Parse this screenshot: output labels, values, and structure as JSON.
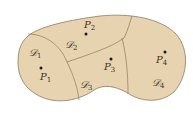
{
  "diagram": {
    "fill_color": "#e8d3b0",
    "stroke_color": "#8a7a62",
    "regions": [
      {
        "name": "D",
        "sub": "1",
        "x": 29,
        "y": 56
      },
      {
        "name": "D",
        "sub": "2",
        "x": 65,
        "y": 48
      },
      {
        "name": "D",
        "sub": "3",
        "x": 80,
        "y": 88
      },
      {
        "name": "D",
        "sub": "4",
        "x": 152,
        "y": 86
      }
    ],
    "points": [
      {
        "name": "P",
        "sub": "1",
        "dot_x": 41,
        "dot_y": 68,
        "x": 40,
        "y": 80
      },
      {
        "name": "P",
        "sub": "2",
        "dot_x": 86,
        "dot_y": 34,
        "x": 84,
        "y": 31
      },
      {
        "name": "P",
        "sub": "3",
        "dot_x": 111,
        "dot_y": 59,
        "x": 104,
        "y": 70
      },
      {
        "name": "P",
        "sub": "4",
        "dot_x": 165,
        "dot_y": 52,
        "x": 156,
        "y": 63
      }
    ]
  }
}
